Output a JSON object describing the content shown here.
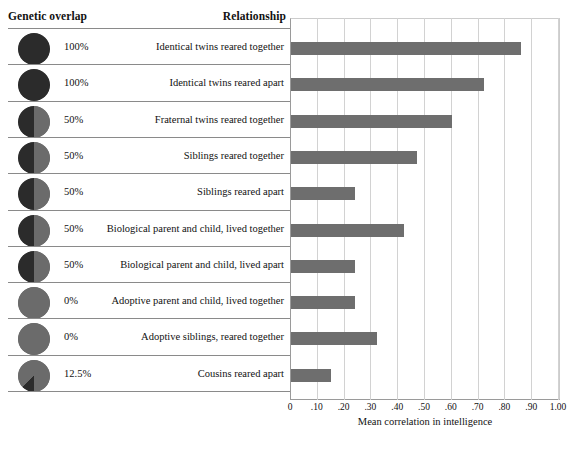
{
  "table": {
    "header_genetic": "Genetic overlap",
    "header_relationship": "Relationship"
  },
  "chart_data": {
    "type": "bar",
    "orientation": "horizontal",
    "title": "",
    "xlabel": "Mean correlation in intelligence",
    "ylabel": "",
    "xlim": [
      0,
      1.0
    ],
    "grid": true,
    "legend": "none",
    "tick_labels": [
      "0",
      ".10",
      ".20",
      ".30",
      ".40",
      ".50",
      ".60",
      ".70",
      ".80",
      ".90",
      "1.00"
    ],
    "tick_values": [
      0,
      0.1,
      0.2,
      0.3,
      0.4,
      0.5,
      0.6,
      0.7,
      0.8,
      0.9,
      1.0
    ],
    "bar_color": "#6e6e6e",
    "categories": [
      "Identical twins reared together",
      "Identical twins reared apart",
      "Fraternal twins reared together",
      "Siblings reared together",
      "Siblings reared apart",
      "Biological parent and child, lived together",
      "Biological parent and child, lived apart",
      "Adoptive parent and child, lived together",
      "Adoptive siblings, reared together",
      "Cousins reared apart"
    ],
    "values": [
      0.86,
      0.72,
      0.6,
      0.47,
      0.24,
      0.42,
      0.24,
      0.24,
      0.32,
      0.15
    ],
    "genetic_overlap_labels": [
      "100%",
      "100%",
      "50%",
      "50%",
      "50%",
      "50%",
      "50%",
      "0%",
      "0%",
      "12.5%"
    ],
    "genetic_overlap_fractions": [
      1.0,
      1.0,
      0.5,
      0.5,
      0.5,
      0.5,
      0.5,
      0.0,
      0.0,
      0.125
    ]
  },
  "colors": {
    "bar": "#6e6e6e",
    "circle_base": "#6b6b6b",
    "circle_shaded": "#2b2b2b",
    "grid": "#d2d2d2",
    "axis": "#9a9a9a",
    "rule": "#8a8a8a",
    "text": "#111111"
  }
}
